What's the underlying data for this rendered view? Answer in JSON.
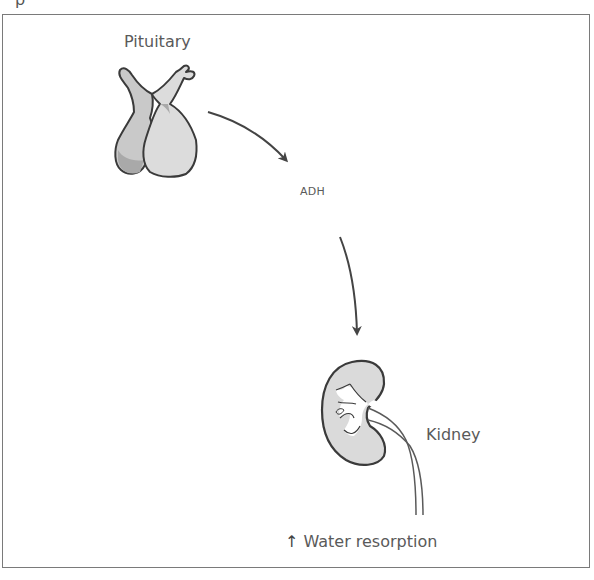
{
  "diagram": {
    "title_fragment": "p",
    "nodes": [
      {
        "id": "pituitary",
        "label": "Pituitary",
        "icon": "pituitary-gland-icon"
      },
      {
        "id": "adh",
        "label": "ADH"
      },
      {
        "id": "kidney",
        "label": "Kidney",
        "icon": "kidney-icon"
      }
    ],
    "edges": [
      {
        "from": "pituitary",
        "to": "adh",
        "type": "curved-arrow"
      },
      {
        "from": "adh",
        "to": "kidney",
        "type": "curved-arrow"
      }
    ],
    "effect": {
      "arrow": "↑",
      "direction": "increase",
      "label": "Water resorption"
    }
  },
  "colors": {
    "outline": "#3a3a3a",
    "fill_light": "#d9d9d9",
    "fill_dark": "#b8b8b8",
    "frame": "#7a7a7a",
    "text": "#5a5a5a"
  }
}
